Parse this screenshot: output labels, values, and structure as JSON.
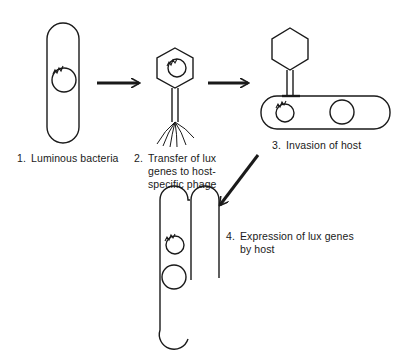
{
  "figure": {
    "type": "process-diagram",
    "title": "",
    "stroke_color": "#1a1a1a",
    "background": "#ffffff"
  },
  "steps": [
    {
      "number": "1.",
      "lines": [
        "Luminous bacteria"
      ],
      "icon": "rod-bacterium-with-lux-plasmid"
    },
    {
      "number": "2.",
      "lines": [
        "Transfer of  lux",
        "genes to host-",
        "specific phage"
      ],
      "icon": "bacteriophage-with-lux-genes"
    },
    {
      "number": "3.",
      "lines": [
        "Invasion of host"
      ],
      "icon": "phage-attached-to-host-bacterium"
    },
    {
      "number": "4.",
      "lines": [
        "Expression of  lux genes",
        "by host"
      ],
      "icon": "host-bacterium-expressing-lux"
    }
  ],
  "arrows": [
    {
      "from": "1",
      "to": "2",
      "direction": "right"
    },
    {
      "from": "2",
      "to": "3",
      "direction": "right"
    },
    {
      "from": "3",
      "to": "4",
      "direction": "down-left"
    }
  ]
}
